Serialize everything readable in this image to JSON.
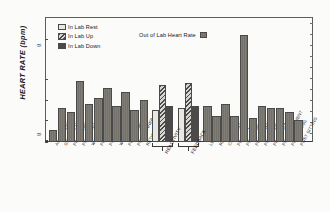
{
  "chart_data": {
    "type": "bar",
    "title": "",
    "xlabel": "",
    "ylabel": "HEART RATE  (bpm)",
    "ylim": [
      55,
      108
    ],
    "ybreaks": [
      0,
      55
    ],
    "yticks": [
      "0",
      "55",
      "65",
      "75",
      "85",
      "105"
    ],
    "grid": false,
    "legend_position": "top-left",
    "series": [
      {
        "name": "In Lab Rest",
        "swatch": "light-solid",
        "categories": [
          "REACTIVITY",
          "FEEDBACK"
        ],
        "values": [
          70,
          71
        ]
      },
      {
        "name": "In Lab Up",
        "swatch": "diagonal-hatch",
        "categories": [
          "REACTIVITY",
          "FEEDBACK"
        ],
        "values": [
          82,
          83
        ]
      },
      {
        "name": "In Lab Down",
        "swatch": "dark-solid",
        "categories": [
          "REACTIVITY",
          "FEEDBACK"
        ],
        "values": [
          72,
          72
        ]
      },
      {
        "name": "Out of Lab Heart Rate",
        "swatch": "grey-vertical",
        "categories": [
          "AWAKENING",
          "GETTING UP",
          "PRE BREAKFAST",
          "POST BREAKFAST",
          "WALK A M",
          "PRE LUNCH",
          "POST LUNCH",
          "WALK P M",
          "PRE DINNER",
          "POST DINNER",
          "RETIRING",
          "LECTURE",
          "READING",
          "CONVERSATION",
          "PRE RUN",
          "POST RUN",
          "PRE ALPHABET",
          "POST ALPHABET",
          "PRE ARGUMENT",
          "POST ARGUMENT",
          "PRE SITTING",
          "POST SITTING"
        ],
        "values": [
          60,
          71,
          69,
          84,
          73,
          76,
          81,
          72,
          79,
          70,
          75,
          72,
          67,
          73,
          67,
          107,
          66,
          72,
          71,
          71,
          69,
          65
        ]
      }
    ],
    "groups": [
      {
        "label": "",
        "bracket": false,
        "categories": [
          "AWAKENING",
          "GETTING UP",
          "PRE BREAKFAST",
          "POST BREAKFAST",
          "WALK A M",
          "PRE LUNCH",
          "POST LUNCH",
          "WALK P M",
          "PRE DINNER",
          "POST DINNER",
          "RETIRING"
        ]
      },
      {
        "label": "REACTIVITY",
        "bracket": true,
        "categories": [
          "REACTIVITY"
        ]
      },
      {
        "label": "FEEDBACK",
        "bracket": true,
        "categories": [
          "FEEDBACK"
        ]
      },
      {
        "label": "",
        "bracket": false,
        "categories": [
          "LECTURE",
          "READING",
          "CONVERSATION",
          "PRE RUN",
          "POST RUN",
          "PRE ALPHABET",
          "POST ALPHABET",
          "PRE ARGUMENT",
          "POST ARGUMENT",
          "PRE SITTING",
          "POST SITTING"
        ]
      }
    ]
  },
  "axis": {
    "ylabel": "HEART RATE  (bpm)",
    "ticks": [
      {
        "label": "105",
        "value": 105
      },
      {
        "label": "85",
        "value": 85
      },
      {
        "label": "75",
        "value": 75
      },
      {
        "label": "65",
        "value": 65
      },
      {
        "label": "55",
        "value": 55
      },
      {
        "label": "0",
        "value": 0
      }
    ]
  },
  "legend": {
    "items": [
      {
        "label": "In Lab Rest",
        "swatch": "sw-rest"
      },
      {
        "label": "In Lab Up",
        "swatch": "sw-up"
      },
      {
        "label": "In Lab Down",
        "swatch": "sw-down"
      }
    ],
    "right_item": {
      "label": "Out of Lab Heart Rate",
      "swatch": "sw-out"
    }
  },
  "xcategories": [
    "AWAKENING",
    "GETTING UP",
    "PRE BREAKFAST",
    "POST BREAKFAST",
    "WALK A M",
    "PRE LUNCH",
    "POST LUNCH",
    "WALK P M",
    "PRE DINNER",
    "POST DINNER",
    "RETIRING",
    "LECTURE",
    "READING",
    "CONVERSATION",
    "PRE RUN",
    "POST RUN",
    "PRE ALPHABET",
    "POST ALPHABET",
    "PRE ARGUMENT",
    "POST ARGUMENT",
    "PRE SITTING",
    "POST SITTING"
  ],
  "group_brackets": [
    {
      "label": "REACTIVITY"
    },
    {
      "label": "FEEDBACK"
    }
  ]
}
